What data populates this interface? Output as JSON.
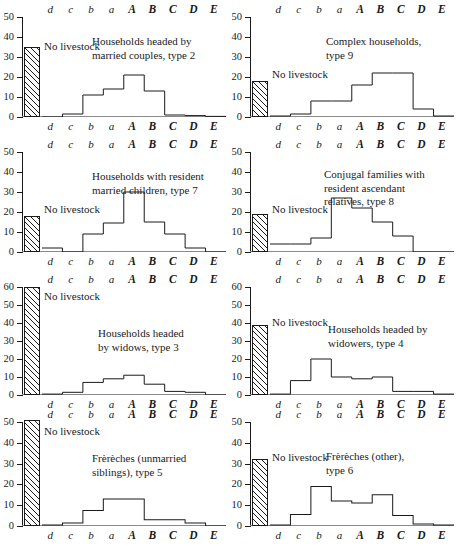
{
  "figure": {
    "categories": [
      "d",
      "c",
      "b",
      "a",
      "A",
      "B",
      "C",
      "D",
      "E"
    ],
    "no_livestock_label": "No livestock"
  },
  "chart_data": [
    {
      "type": "bar",
      "title": "Households headed by\nmarried couples, type 2",
      "categories": [
        "d",
        "c",
        "b",
        "a",
        "A",
        "B",
        "C",
        "D",
        "E"
      ],
      "values": [
        0,
        1.5,
        11,
        14,
        21,
        13,
        1,
        0.7,
        0.3
      ],
      "no_livestock": 35,
      "ylim": [
        0,
        50
      ],
      "yticks": [
        0,
        10,
        20,
        30,
        40,
        50
      ],
      "xlabel": "",
      "ylabel": "",
      "grid": false,
      "legend": false
    },
    {
      "type": "bar",
      "title": "Complex households,\ntype 9",
      "categories": [
        "d",
        "c",
        "b",
        "a",
        "A",
        "B",
        "C",
        "D",
        "E"
      ],
      "values": [
        0.5,
        1.5,
        8,
        8,
        16,
        22,
        22,
        4,
        0.5
      ],
      "no_livestock": 18,
      "ylim": [
        0,
        50
      ],
      "yticks": [
        0,
        10,
        20,
        30,
        40,
        50
      ],
      "xlabel": "",
      "ylabel": "",
      "grid": false,
      "legend": false
    },
    {
      "type": "bar",
      "title": "Households with resident\nmarried children, type 7",
      "categories": [
        "d",
        "c",
        "b",
        "a",
        "A",
        "B",
        "C",
        "D",
        "E"
      ],
      "values": [
        2,
        0,
        9,
        14.5,
        30,
        15,
        9,
        2,
        0
      ],
      "no_livestock": 18,
      "ylim": [
        0,
        50
      ],
      "yticks": [
        0,
        10,
        20,
        30,
        40,
        50
      ],
      "xlabel": "",
      "ylabel": "",
      "grid": false,
      "legend": false
    },
    {
      "type": "bar",
      "title": "Conjugal families with\nresident ascendant\nrelatives, type 8",
      "categories": [
        "d",
        "c",
        "b",
        "a",
        "A",
        "B",
        "C",
        "D",
        "E"
      ],
      "values": [
        4,
        4,
        7,
        27,
        22,
        15,
        8,
        0,
        0
      ],
      "no_livestock": 19,
      "ylim": [
        0,
        50
      ],
      "yticks": [
        0,
        10,
        20,
        30,
        40,
        50
      ],
      "xlabel": "",
      "ylabel": "",
      "grid": false,
      "legend": false
    },
    {
      "type": "bar",
      "title": "Households headed\nby widows, type 3",
      "categories": [
        "d",
        "c",
        "b",
        "a",
        "A",
        "B",
        "C",
        "D",
        "E"
      ],
      "values": [
        0.5,
        1.5,
        7,
        9,
        11,
        6,
        2,
        1.5,
        0
      ],
      "no_livestock": 60,
      "ylim": [
        0,
        60
      ],
      "yticks": [
        0,
        10,
        20,
        30,
        40,
        50,
        60
      ],
      "xlabel": "",
      "ylabel": "",
      "grid": false,
      "legend": false
    },
    {
      "type": "bar",
      "title": "Households headed by\nwidowers, type 4",
      "categories": [
        "d",
        "c",
        "b",
        "a",
        "A",
        "B",
        "C",
        "D",
        "E"
      ],
      "values": [
        0.5,
        8,
        20,
        10,
        9,
        10,
        2,
        2,
        0.5
      ],
      "no_livestock": 39,
      "ylim": [
        0,
        60
      ],
      "yticks": [
        0,
        10,
        20,
        30,
        40,
        50,
        60
      ],
      "xlabel": "",
      "ylabel": "",
      "grid": false,
      "legend": false
    },
    {
      "type": "bar",
      "title": "Frèrèches (unmarried\nsiblings), type 5",
      "categories": [
        "d",
        "c",
        "b",
        "a",
        "A",
        "B",
        "C",
        "D",
        "E"
      ],
      "values": [
        0.5,
        1.5,
        7.5,
        13,
        13,
        3,
        3,
        1.5,
        0
      ],
      "no_livestock": 51,
      "ylim": [
        0,
        50
      ],
      "yticks": [
        0,
        10,
        20,
        30,
        40,
        50
      ],
      "xlabel": "",
      "ylabel": "",
      "grid": false,
      "legend": false
    },
    {
      "type": "bar",
      "title": "Frèrèches (other),\ntype 6",
      "categories": [
        "d",
        "c",
        "b",
        "a",
        "A",
        "B",
        "C",
        "D",
        "E"
      ],
      "values": [
        0.5,
        5.5,
        19,
        12,
        11,
        15,
        5,
        1,
        0.5
      ],
      "no_livestock": 32,
      "ylim": [
        0,
        50
      ],
      "yticks": [
        0,
        10,
        20,
        30,
        40,
        50
      ],
      "xlabel": "",
      "ylabel": "",
      "grid": false,
      "legend": false
    }
  ]
}
